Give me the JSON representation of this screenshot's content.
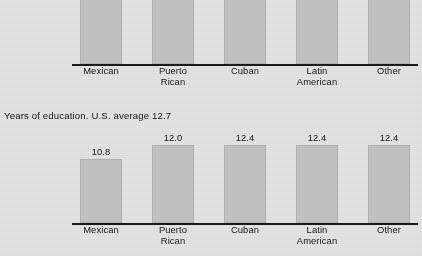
{
  "figure": {
    "background_color": "#e4e4e4",
    "bar_color": "#c2c2c2",
    "axis_color": "#1a1a1a",
    "caption": "Years of education. U.S. average 12.7"
  },
  "categories": [
    "Mexican",
    "Puerto\nRican",
    "Cuban",
    "Latin\nAmerican",
    "Other"
  ],
  "chart_data": [
    {
      "type": "bar",
      "title": "",
      "xlabel": "",
      "ylabel": "",
      "grid": false,
      "legend": "none",
      "note": "Top chart is cropped by the top edge of the screenshot; bar tops and most value labels are cut off.",
      "categories": [
        "Mexican",
        "Puerto Rican",
        "Cuban",
        "Latin American",
        "Other"
      ],
      "value_labels": [
        "",
        "$15,185",
        "",
        "",
        ""
      ],
      "value_labels_visible": [
        false,
        true,
        false,
        false,
        false
      ],
      "values": [
        21300,
        15185,
        25000,
        23900,
        20400
      ],
      "bar_pixel_heights": [
        110,
        87,
        112,
        112,
        107
      ]
    },
    {
      "type": "bar",
      "title": "Years of education. U.S. average 12.7",
      "xlabel": "",
      "ylabel": "Years of education",
      "grid": false,
      "legend": "none",
      "reference_value": 12.7,
      "reference_label": "U.S. average 12.7",
      "categories": [
        "Mexican",
        "Puerto Rican",
        "Cuban",
        "Latin American",
        "Other"
      ],
      "value_labels": [
        "10.8",
        "12.0",
        "12.4",
        "12.4",
        "12.4"
      ],
      "values": [
        10.8,
        12.0,
        12.4,
        12.4,
        12.4
      ],
      "ylim": [
        0,
        13.2
      ],
      "bar_pixel_heights": [
        64,
        78,
        78,
        78,
        78
      ]
    }
  ]
}
